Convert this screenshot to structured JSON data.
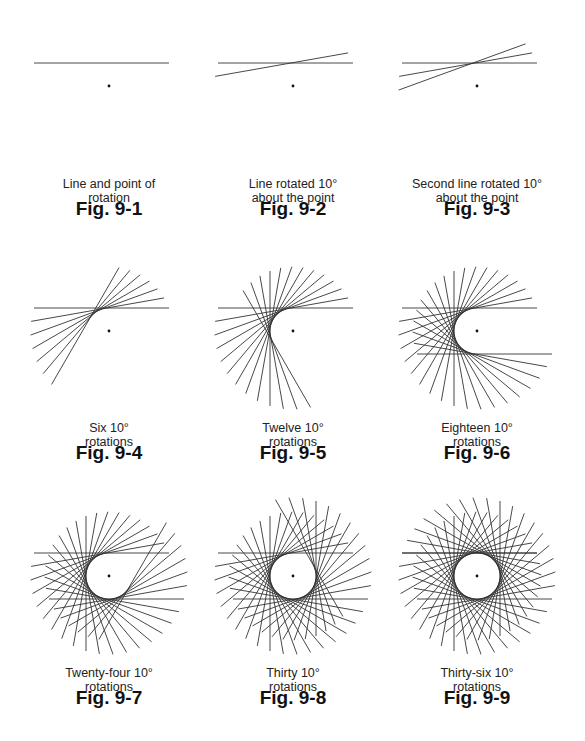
{
  "figures": [
    {
      "id": "fig-9-1",
      "label": "Fig. 9-1",
      "caption": [
        "Line and point of",
        "rotation"
      ],
      "rotations": 0,
      "center": [
        109,
        86
      ]
    },
    {
      "id": "fig-9-2",
      "label": "Fig. 9-2",
      "caption": [
        "Line rotated 10°",
        "about the point"
      ],
      "rotations": 1,
      "center": [
        293,
        86
      ]
    },
    {
      "id": "fig-9-3",
      "label": "Fig. 9-3",
      "caption": [
        "Second line rotated 10°",
        "about the point"
      ],
      "rotations": 2,
      "center": [
        477,
        86
      ]
    },
    {
      "id": "fig-9-4",
      "label": "Fig. 9-4",
      "caption": [
        "Six 10°",
        "rotations"
      ],
      "rotations": 6,
      "center": [
        109,
        331
      ]
    },
    {
      "id": "fig-9-5",
      "label": "Fig. 9-5",
      "caption": [
        "Twelve 10°",
        "rotations"
      ],
      "rotations": 12,
      "center": [
        293,
        331
      ]
    },
    {
      "id": "fig-9-6",
      "label": "Fig. 9-6",
      "caption": [
        "Eighteen 10°",
        "rotations"
      ],
      "rotations": 18,
      "center": [
        477,
        331
      ]
    },
    {
      "id": "fig-9-7",
      "label": "Fig. 9-7",
      "caption": [
        "Twenty-four 10°",
        "rotations"
      ],
      "rotations": 24,
      "center": [
        109,
        576
      ]
    },
    {
      "id": "fig-9-8",
      "label": "Fig. 9-8",
      "caption": [
        "Thirty 10°",
        "rotations"
      ],
      "rotations": 30,
      "center": [
        293,
        576
      ]
    },
    {
      "id": "fig-9-9",
      "label": "Fig. 9-9",
      "caption": [
        "Thirty-six 10°",
        "rotations"
      ],
      "rotations": 36,
      "center": [
        477,
        576
      ]
    }
  ],
  "geometry": {
    "step_degrees": 10,
    "circle_radius": 23,
    "line_back_length": 75,
    "line_front_length": 60,
    "line_color": "#333333",
    "dot_color": "#111111"
  }
}
